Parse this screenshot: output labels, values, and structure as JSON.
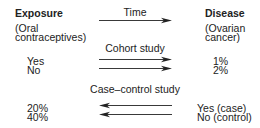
{
  "header": {
    "exposure_title": "Exposure",
    "exposure_sub1": "(Oral",
    "exposure_sub2": "contraceptives)",
    "time_label": "Time",
    "disease_title": "Disease",
    "disease_sub1": "(Ovarian",
    "disease_sub2": "cancer)"
  },
  "cohort": {
    "label": "Cohort study",
    "rows": [
      {
        "exposure": "Yes",
        "outcome": "1%"
      },
      {
        "exposure": "No",
        "outcome": "2%"
      }
    ],
    "arrow_direction": "right"
  },
  "case_control": {
    "label": "Case–control study",
    "rows": [
      {
        "exposure": "20%",
        "outcome": "Yes (case)"
      },
      {
        "exposure": "40%",
        "outcome": "No (control)"
      }
    ],
    "arrow_direction": "left"
  },
  "colors": {
    "text": "#222222",
    "arrow": "#222222",
    "background": "#ffffff"
  }
}
